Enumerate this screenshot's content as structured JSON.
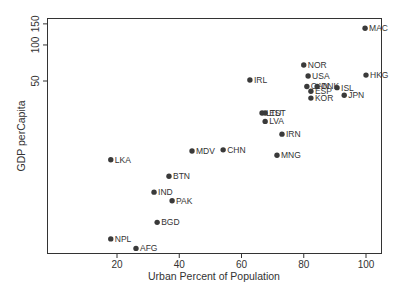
{
  "chart_data": {
    "type": "scatter",
    "title": "",
    "xlabel": "Urban Percent of Population",
    "ylabel": "GDP perCapita",
    "xlim": [
      14,
      103
    ],
    "ylim_log": [
      1.85,
      165
    ],
    "y_scale": "log",
    "x_ticks": [
      20,
      40,
      60,
      80,
      100
    ],
    "y_ticks": [
      50,
      100,
      150
    ],
    "grid": false,
    "legend": null,
    "colors": {
      "point": "#3a3a3a",
      "axis": "#333333"
    },
    "points": [
      {
        "label": "MAC",
        "x": 99.7,
        "y": 138
      },
      {
        "label": "HKG",
        "x": 100.0,
        "y": 56
      },
      {
        "label": "NOR",
        "x": 80.0,
        "y": 68
      },
      {
        "label": "USA",
        "x": 81.4,
        "y": 55
      },
      {
        "label": "CAN",
        "x": 81.0,
        "y": 45
      },
      {
        "label": "DNK",
        "x": 84.3,
        "y": 45
      },
      {
        "label": "ESP",
        "x": 82.3,
        "y": 41
      },
      {
        "label": "KOR",
        "x": 82.3,
        "y": 36
      },
      {
        "label": "ISL",
        "x": 90.7,
        "y": 44
      },
      {
        "label": "JPN",
        "x": 93.0,
        "y": 38
      },
      {
        "label": "IRL",
        "x": 62.7,
        "y": 51
      },
      {
        "label": "LTU",
        "x": 66.6,
        "y": 27
      },
      {
        "label": "EST",
        "x": 67.6,
        "y": 27
      },
      {
        "label": "LVA",
        "x": 67.6,
        "y": 23
      },
      {
        "label": "IRN",
        "x": 73.0,
        "y": 18
      },
      {
        "label": "MNG",
        "x": 71.4,
        "y": 12
      },
      {
        "label": "MDV",
        "x": 44.1,
        "y": 13
      },
      {
        "label": "CHN",
        "x": 54.1,
        "y": 13.3
      },
      {
        "label": "LKA",
        "x": 18.0,
        "y": 11
      },
      {
        "label": "BTN",
        "x": 36.7,
        "y": 8.0
      },
      {
        "label": "IND",
        "x": 31.9,
        "y": 5.9
      },
      {
        "label": "PAK",
        "x": 37.7,
        "y": 5.0
      },
      {
        "label": "BGD",
        "x": 32.9,
        "y": 3.3
      },
      {
        "label": "NPL",
        "x": 18.0,
        "y": 2.4
      },
      {
        "label": "AFG",
        "x": 26.1,
        "y": 2.0
      }
    ]
  }
}
